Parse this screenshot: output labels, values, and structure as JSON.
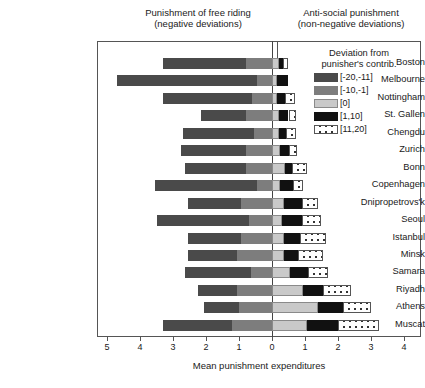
{
  "header": {
    "left_line1": "Punishment of free riding",
    "left_line2": "(negative deviations)",
    "right_line1": "Anti-social punishment",
    "right_line2": "(non-negative deviations)"
  },
  "legend": {
    "title_line1": "Deviation from",
    "title_line2": "punisher's contrib.",
    "items": [
      {
        "label": "[-20,-11]",
        "color": "#4a4a4a",
        "swatch": "solid-dark-gray"
      },
      {
        "label": "[-10,-1]",
        "color": "#7d7d7d",
        "swatch": "solid-medium-gray"
      },
      {
        "label": "[0]",
        "color": "#c9c9c9",
        "swatch": "solid-light-gray"
      },
      {
        "label": "[1,10]",
        "color": "#111111",
        "swatch": "solid-black"
      },
      {
        "label": "[11,20]",
        "color": "#ffffff",
        "swatch": "white-dotted"
      }
    ]
  },
  "axis": {
    "title": "Mean punishment expenditures",
    "ticks": [
      {
        "label": "5",
        "value": -5
      },
      {
        "label": "4",
        "value": -4
      },
      {
        "label": "3",
        "value": -3
      },
      {
        "label": "2",
        "value": -2
      },
      {
        "label": "1",
        "value": -1
      },
      {
        "label": "0",
        "value": 0
      },
      {
        "label": "1",
        "value": 1
      },
      {
        "label": "2",
        "value": 2
      },
      {
        "label": "3",
        "value": 3
      },
      {
        "label": "4",
        "value": 4
      }
    ]
  },
  "chart_data": {
    "type": "bar",
    "orientation": "horizontal",
    "stacked": true,
    "diverging": true,
    "title": "",
    "xlabel": "Mean punishment expenditures",
    "ylabel": "",
    "xlim": [
      -5.3,
      4.4
    ],
    "grid": false,
    "legend_position": "right",
    "zero_reference": 0,
    "panels": [
      "Punishment of free riding (negative deviations)",
      "Anti-social punishment (non-negative deviations)"
    ],
    "categories": [
      "Boston",
      "Melbourne",
      "Nottingham",
      "St. Gallen",
      "Chengdu",
      "Zurich",
      "Bonn",
      "Copenhagen",
      "Dnipropetrovs'k",
      "Seoul",
      "Istanbul",
      "Minsk",
      "Samara",
      "Riyadh",
      "Athens",
      "Muscat"
    ],
    "series": [
      {
        "name": "[-20,-11]",
        "color": "#4a4a4a",
        "values": [
          2.5,
          4.25,
          2.7,
          1.35,
          2.15,
          1.95,
          1.85,
          3.1,
          1.6,
          2.8,
          1.6,
          1.5,
          2.0,
          1.2,
          1.05,
          2.1
        ]
      },
      {
        "name": "[-10,-1]",
        "color": "#7d7d7d",
        "values": [
          0.8,
          0.45,
          0.6,
          0.8,
          0.55,
          0.8,
          0.8,
          0.45,
          0.95,
          0.7,
          0.95,
          1.05,
          0.65,
          1.05,
          1.0,
          1.2
        ]
      },
      {
        "name": "[0]",
        "color": "#c9c9c9",
        "values": [
          0.2,
          0.15,
          0.15,
          0.2,
          0.2,
          0.25,
          0.4,
          0.25,
          0.35,
          0.3,
          0.35,
          0.35,
          0.55,
          0.95,
          1.4,
          1.05
        ]
      },
      {
        "name": "[1,10]",
        "color": "#111111",
        "values": [
          0.12,
          0.35,
          0.25,
          0.3,
          0.22,
          0.25,
          0.22,
          0.4,
          0.55,
          0.6,
          0.5,
          0.45,
          0.55,
          0.6,
          0.75,
          0.95
        ]
      },
      {
        "name": "[11,20]",
        "color": "#ffffff",
        "values": [
          0.18,
          0.0,
          0.3,
          0.22,
          0.3,
          0.25,
          0.45,
          0.3,
          0.5,
          0.6,
          0.8,
          0.75,
          0.6,
          0.85,
          0.85,
          1.25
        ]
      }
    ]
  }
}
